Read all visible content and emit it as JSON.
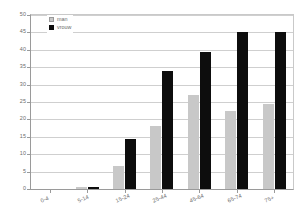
{
  "chart_data": {
    "type": "bar",
    "title": "",
    "subtitle": "",
    "xlabel": "",
    "ylabel": "",
    "categories": [
      "0-4",
      "5-14",
      "15-24",
      "25-44",
      "45-64",
      "65-74",
      "75+"
    ],
    "series": [
      {
        "name": "man",
        "color": "#c8c8c8",
        "values": [
          0,
          0.5,
          6.5,
          18,
          27,
          22.5,
          24.5
        ]
      },
      {
        "name": "vrouw",
        "color": "#0d0d0d",
        "values": [
          0,
          0.6,
          14.5,
          34,
          39.5,
          45,
          45
        ]
      }
    ],
    "ylim": [
      0,
      50
    ],
    "ytick_step": 5,
    "yticks": [
      0,
      5,
      10,
      15,
      20,
      25,
      30,
      35,
      40,
      45,
      50
    ],
    "ytick_labels": [
      "0",
      "5",
      "10",
      "15",
      "20",
      "25",
      "30",
      "35",
      "40",
      "45",
      "50"
    ],
    "grid": true,
    "grid_axis": "y",
    "legend_position": "top-left",
    "bar_orientation": "vertical",
    "grouping": "clustered",
    "xtick_label_rotation": -22
  },
  "legend": {
    "items": [
      {
        "label": "man",
        "swatch": "legend-swatch-man"
      },
      {
        "label": "vrouw",
        "swatch": "legend-swatch-vrouw"
      }
    ]
  },
  "colors": {
    "man": "#c8c8c8",
    "vrouw": "#0d0d0d",
    "gridline": "#cfcfcf",
    "axis": "#9a9a9a",
    "text": "#6b6b6b",
    "background": "#ffffff"
  }
}
